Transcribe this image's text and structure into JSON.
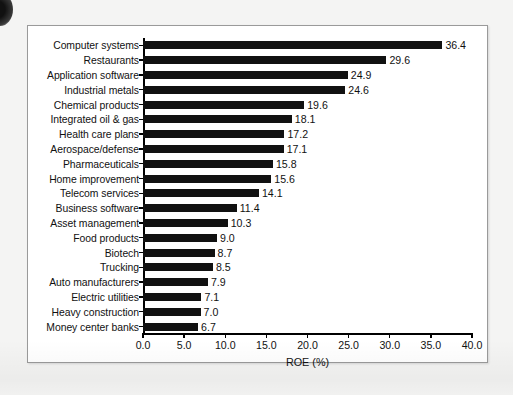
{
  "chart_data": {
    "type": "bar",
    "orientation": "horizontal",
    "title": "",
    "xlabel": "ROE (%)",
    "ylabel": "",
    "xlim": [
      0.0,
      40.0
    ],
    "xticks": [
      "0.0",
      "5.0",
      "10.0",
      "15.0",
      "20.0",
      "25.0",
      "30.0",
      "35.0",
      "40.0"
    ],
    "xtick_values": [
      0,
      5,
      10,
      15,
      20,
      25,
      30,
      35,
      40
    ],
    "grid": false,
    "legend": false,
    "bar_color": "#111111",
    "categories": [
      "Computer systems",
      "Restaurants",
      "Application software",
      "Industrial metals",
      "Chemical products",
      "Integrated oil & gas",
      "Health care plans",
      "Aerospace/defense",
      "Pharmaceuticals",
      "Home improvement",
      "Telecom services",
      "Business software",
      "Asset management",
      "Food products",
      "Biotech",
      "Trucking",
      "Auto manufacturers",
      "Electric utilities",
      "Heavy construction",
      "Money center banks"
    ],
    "values": [
      36.4,
      29.6,
      24.9,
      24.6,
      19.6,
      18.1,
      17.2,
      17.1,
      15.8,
      15.6,
      14.1,
      11.4,
      10.3,
      9.0,
      8.7,
      8.5,
      7.9,
      7.1,
      7.0,
      6.7
    ],
    "value_labels": [
      "36.4",
      "29.6",
      "24.9",
      "24.6",
      "19.6",
      "18.1",
      "17.2",
      "17.1",
      "15.8",
      "15.6",
      "14.1",
      "11.4",
      "10.3",
      "9.0",
      "8.7",
      "8.5",
      "7.9",
      "7.1",
      "7.0",
      "6.7"
    ]
  },
  "page": {
    "background_color": "#f4f4f3",
    "chart_background_color": "#ffffff",
    "chart_border_color": "#9a9a9a"
  }
}
